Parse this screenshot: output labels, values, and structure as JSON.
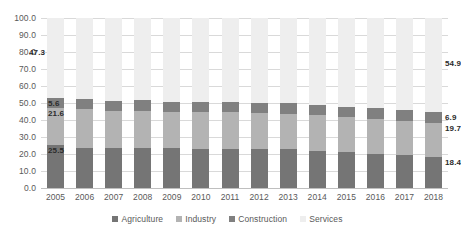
{
  "chart_data": {
    "type": "bar",
    "subtype": "stacked-100-percent",
    "title": "",
    "xlabel": "",
    "ylabel": "",
    "ylim": [
      0,
      100
    ],
    "ytick_labels": [
      "100.0",
      "90.0",
      "80.0",
      "70.0",
      "60.0",
      "50.0",
      "40.0",
      "30.0",
      "20.0",
      "10.0",
      "0.0"
    ],
    "ytick_values": [
      100,
      90,
      80,
      70,
      60,
      50,
      40,
      30,
      20,
      10,
      0
    ],
    "grid": true,
    "legend_position": "bottom",
    "categories": [
      "2005",
      "2006",
      "2007",
      "2008",
      "2009",
      "2010",
      "2011",
      "2012",
      "2013",
      "2014",
      "2015",
      "2016",
      "2017",
      "2018"
    ],
    "series": [
      {
        "name": "Agriculture",
        "color": "#757575",
        "values": [
          25.5,
          23.8,
          23.6,
          23.6,
          23.3,
          23.2,
          22.9,
          22.8,
          22.8,
          21.5,
          21.4,
          20.3,
          19.2,
          18.4
        ]
      },
      {
        "name": "Industry",
        "color": "#b3b3b3",
        "values": [
          21.6,
          22.4,
          21.8,
          21.9,
          21.6,
          21.7,
          21.8,
          21.3,
          20.7,
          21.2,
          20.3,
          20.2,
          20.0,
          19.7
        ]
      },
      {
        "name": "Construction",
        "color": "#808080",
        "values": [
          5.6,
          6.2,
          6.0,
          6.1,
          5.7,
          6.0,
          6.1,
          6.2,
          6.4,
          6.3,
          6.0,
          6.4,
          6.7,
          6.9
        ]
      },
      {
        "name": "Services",
        "color": "#eeeeee",
        "values": [
          47.3,
          47.6,
          48.6,
          48.4,
          49.4,
          49.1,
          49.2,
          49.7,
          50.1,
          51.0,
          52.3,
          53.1,
          54.1,
          54.9
        ]
      }
    ],
    "data_labels": {
      "2005": {
        "Agriculture": "25.5",
        "Industry": "21.6",
        "Construction": "5.6",
        "Services": "47.3"
      },
      "2018": {
        "Agriculture": "18.4",
        "Industry": "19.7",
        "Construction": "6.9",
        "Services": "54.9"
      }
    }
  },
  "legend": {
    "items": [
      {
        "label": "Agriculture"
      },
      {
        "label": "Industry"
      },
      {
        "label": "Construction"
      },
      {
        "label": "Services"
      }
    ]
  }
}
